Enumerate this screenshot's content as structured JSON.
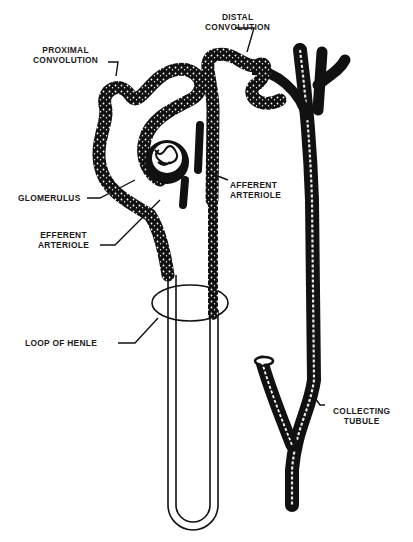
{
  "diagram": {
    "colors": {
      "ink": "#111111",
      "background": "#ffffff",
      "speckle": "#ffffff"
    },
    "labels": {
      "distal_convolution": [
        "DISTAL",
        "CONVOLUTION"
      ],
      "proximal_convolution": [
        "PROXIMAL",
        "CONVOLUTION"
      ],
      "glomerulus": [
        "GLOMERULUS"
      ],
      "afferent_arteriole": [
        "AFFERENT",
        "ARTERIOLE"
      ],
      "efferent_arteriole": [
        "EFFERENT",
        "ARTERIOLE"
      ],
      "loop_of_henle": [
        "LOOP OF HENLE"
      ],
      "collecting_tubule": [
        "COLLECTING",
        "TUBULE"
      ]
    }
  }
}
